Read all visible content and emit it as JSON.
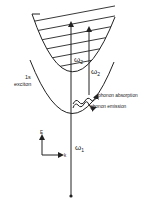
{
  "diagram": {
    "labels": {
      "omega2_upper": "ω",
      "omega2_upper_sub": "2",
      "omega2_right": "ω",
      "omega2_right_sub": "2",
      "omega1": "ω",
      "omega1_sub": "1",
      "exciton_line1": "1s",
      "exciton_line2": "exciton",
      "phonon_absorption": "phonon absorption",
      "phonon_emission": "phonon emission",
      "axis_e": "E",
      "axis_k": "k"
    },
    "colors": {
      "ink": "#222222",
      "background": "#ffffff"
    }
  }
}
